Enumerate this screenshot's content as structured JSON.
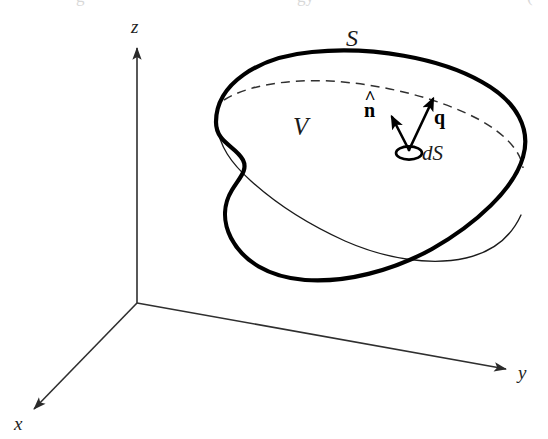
{
  "figure": {
    "kind": "vector-calculus-diagram",
    "background_color": "#ffffff",
    "ink_color": "#000000",
    "width": 548,
    "height": 439
  },
  "axes": {
    "origin": {
      "x": 137,
      "y": 303
    },
    "items": [
      {
        "name": "z",
        "label": "z",
        "label_x": 131,
        "label_y": 17,
        "line": {
          "x1": 137,
          "y1": 303,
          "x2": 137,
          "y2": 46
        },
        "arrow": "up"
      },
      {
        "name": "y",
        "label": "y",
        "label_x": 518,
        "label_y": 363,
        "line": {
          "x1": 137,
          "y1": 303,
          "x2": 508,
          "y2": 370
        },
        "arrow": "right-down"
      },
      {
        "name": "x",
        "label": "x",
        "label_x": 14,
        "label_y": 414,
        "line": {
          "x1": 137,
          "y1": 303,
          "x2": 32,
          "y2": 411
        },
        "arrow": "left-down"
      }
    ]
  },
  "body": {
    "surface_label": "S",
    "surface_label_x": 346,
    "surface_label_y": 26,
    "volume_label": "V",
    "volume_label_x": 293,
    "volume_label_y": 114,
    "outline_stroke_width": 4.2,
    "inner_edge_stroke_width": 1.4,
    "dashed_stroke_width": 1.5,
    "dash_pattern": "9 6"
  },
  "element": {
    "ds_label": "dS",
    "ds_label_x": 422,
    "ds_label_y": 143,
    "patch_center": {
      "x": 409,
      "y": 152
    },
    "patch_rx": 13,
    "patch_ry": 6.5
  },
  "vectors": [
    {
      "name": "normal",
      "label": "n",
      "accent": "hat",
      "label_x": 364,
      "label_y": 100,
      "tail": {
        "x": 409,
        "y": 150
      },
      "tip": {
        "x": 391,
        "y": 115
      }
    },
    {
      "name": "flux",
      "label": "q",
      "accent": "bold",
      "label_x": 434,
      "label_y": 107,
      "tail": {
        "x": 409,
        "y": 150
      },
      "tip": {
        "x": 433,
        "y": 97
      }
    }
  ],
  "artifacts": {
    "top_cropped_text": [
      {
        "text": "g",
        "x": 76,
        "y": -12
      },
      {
        "text": "gy",
        "x": 297,
        "y": -12
      },
      {
        "text": "(",
        "x": 527,
        "y": -12
      }
    ]
  }
}
